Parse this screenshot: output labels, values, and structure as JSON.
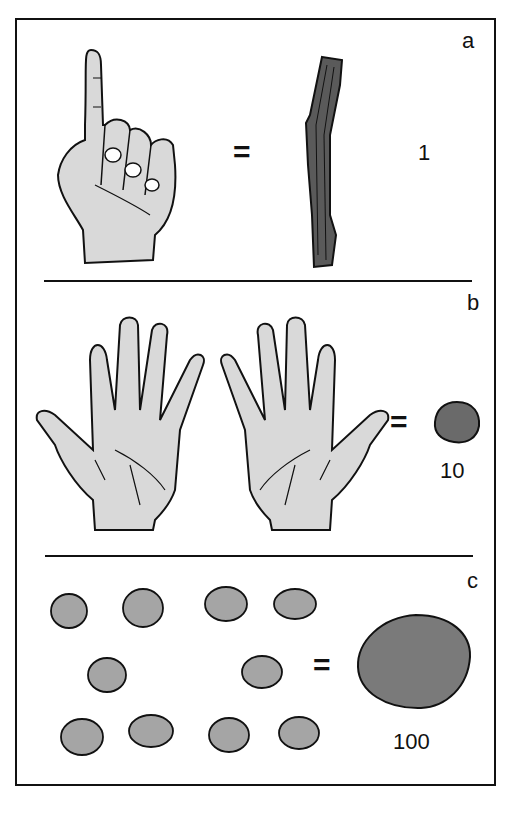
{
  "panels": [
    {
      "letter": "a",
      "equals": "=",
      "value": "1",
      "left_item": "hand-one-finger",
      "right_item": "stick"
    },
    {
      "letter": "b",
      "equals": "=",
      "value": "10",
      "left_item": "two-open-hands",
      "right_item": "small-pebble"
    },
    {
      "letter": "c",
      "equals": "=",
      "value": "100",
      "left_item": "ten-small-pebbles",
      "right_item": "large-stone"
    }
  ],
  "colors": {
    "line": "#111111",
    "skin": "#d9d9d9",
    "stick": "#5a5a5a",
    "stone": "#7a7a7a",
    "pebble": "#a5a5a5"
  }
}
